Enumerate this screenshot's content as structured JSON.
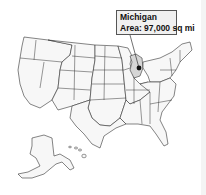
{
  "map": {
    "title": "United States",
    "selected_state": "Michigan",
    "highlight_color": "#d6d6d6",
    "default_fill": "#f7f7f7",
    "border_color": "#333333"
  },
  "tooltip": {
    "state_name": "Michigan",
    "area_text": "Area: 97,000 sq mi"
  }
}
